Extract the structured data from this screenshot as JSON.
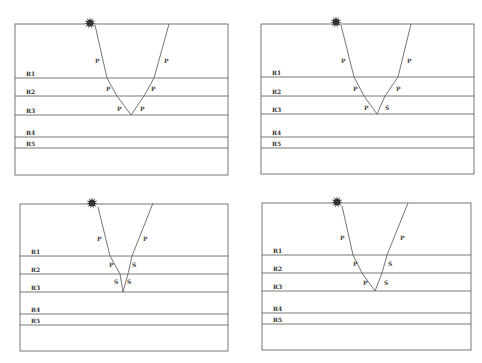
{
  "layer_labels": [
    "R1",
    "R2",
    "R3",
    "R4",
    "R5"
  ],
  "colors": {
    "line": "#555555",
    "ray": "#666666",
    "text": "#333333",
    "source": "#333333"
  },
  "source_icon": "explosion-star-icon",
  "panels": [
    {
      "id": "top-left",
      "box": {
        "x1": 15,
        "y1": 24,
        "x2": 228,
        "y2": 175
      },
      "layers_y": [
        78,
        96,
        115,
        137,
        148
      ],
      "source": {
        "x": 90,
        "y": 23
      },
      "ray": [
        [
          95,
          25
        ],
        [
          107,
          78
        ],
        [
          117,
          96
        ],
        [
          131,
          115
        ],
        [
          144,
          96
        ],
        [
          154,
          78
        ],
        [
          169,
          24
        ]
      ],
      "wave_labels": [
        {
          "text": "P",
          "x": 95,
          "y": 63
        },
        {
          "text": "P",
          "x": 106,
          "y": 91
        },
        {
          "text": "P",
          "x": 117,
          "y": 111
        },
        {
          "text": "P",
          "x": 140,
          "y": 111
        },
        {
          "text": "P",
          "x": 151,
          "y": 91
        },
        {
          "text": "P",
          "x": 164,
          "y": 63
        }
      ]
    },
    {
      "id": "top-right",
      "box": {
        "x1": 261,
        "y1": 24,
        "x2": 474,
        "y2": 174
      },
      "layers_y": [
        77,
        96,
        114,
        137,
        148
      ],
      "source": {
        "x": 336,
        "y": 22
      },
      "ray": [
        [
          341,
          25
        ],
        [
          354,
          77
        ],
        [
          364,
          96
        ],
        [
          377,
          114
        ],
        [
          385,
          96
        ],
        [
          398,
          77
        ],
        [
          411,
          24
        ]
      ],
      "wave_labels": [
        {
          "text": "P",
          "x": 341,
          "y": 63
        },
        {
          "text": "P",
          "x": 353,
          "y": 91
        },
        {
          "text": "P",
          "x": 364,
          "y": 110
        },
        {
          "text": "S",
          "x": 385,
          "y": 110
        },
        {
          "text": "P",
          "x": 396,
          "y": 91
        },
        {
          "text": "P",
          "x": 407,
          "y": 63
        }
      ]
    },
    {
      "id": "bottom-left",
      "box": {
        "x1": 20,
        "y1": 204,
        "x2": 228,
        "y2": 351
      },
      "layers_y": [
        256,
        274,
        292,
        314,
        325
      ],
      "source": {
        "x": 92,
        "y": 203
      },
      "ray": [
        [
          98,
          207
        ],
        [
          110,
          256
        ],
        [
          120,
          274
        ],
        [
          123,
          292
        ],
        [
          128,
          274
        ],
        [
          132,
          256
        ],
        [
          153,
          203
        ]
      ],
      "wave_labels": [
        {
          "text": "P",
          "x": 97,
          "y": 241
        },
        {
          "text": "P",
          "x": 109,
          "y": 267
        },
        {
          "text": "S",
          "x": 114,
          "y": 284
        },
        {
          "text": "S",
          "x": 127,
          "y": 284
        },
        {
          "text": "S",
          "x": 132,
          "y": 267
        },
        {
          "text": "P",
          "x": 143,
          "y": 241
        }
      ]
    },
    {
      "id": "bottom-right",
      "box": {
        "x1": 262,
        "y1": 203,
        "x2": 471,
        "y2": 350
      },
      "layers_y": [
        255,
        273,
        291,
        313,
        324
      ],
      "source": {
        "x": 337,
        "y": 202
      },
      "ray": [
        [
          342,
          206
        ],
        [
          353,
          255
        ],
        [
          362,
          273
        ],
        [
          375,
          291
        ],
        [
          382,
          273
        ],
        [
          387,
          255
        ],
        [
          408,
          203
        ]
      ],
      "wave_labels": [
        {
          "text": "P",
          "x": 340,
          "y": 240
        },
        {
          "text": "P",
          "x": 353,
          "y": 266
        },
        {
          "text": "P",
          "x": 363,
          "y": 285
        },
        {
          "text": "S",
          "x": 384,
          "y": 285
        },
        {
          "text": "S",
          "x": 388,
          "y": 266
        },
        {
          "text": "P",
          "x": 400,
          "y": 240
        }
      ]
    }
  ]
}
